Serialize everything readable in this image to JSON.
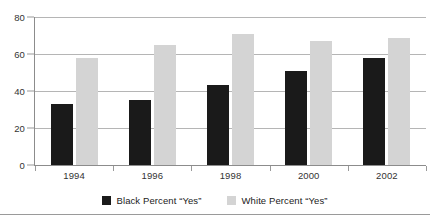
{
  "chart_data": {
    "type": "bar",
    "title": "",
    "subtitle": "",
    "xlabel": "",
    "ylabel": "",
    "categories": [
      "1994",
      "1996",
      "1998",
      "2000",
      "2002"
    ],
    "series": [
      {
        "name": "Black Percent “Yes”",
        "color": "#1a1a1a",
        "values": [
          33,
          35,
          43,
          51,
          58
        ]
      },
      {
        "name": "White Percent “Yes”",
        "color": "#d4d4d4",
        "values": [
          58,
          65,
          71,
          67,
          68.5
        ]
      }
    ],
    "ylim": [
      0,
      80
    ],
    "yticks": [
      0,
      20,
      40,
      60,
      80
    ],
    "ytick_labels": [
      "0",
      "20",
      "40",
      "60",
      "80"
    ],
    "grid": true,
    "grid_axis": "y",
    "legend_position": "bottom-center"
  },
  "legend": {
    "entries": [
      {
        "label": "Black Percent “Yes”",
        "swatch": "black"
      },
      {
        "label": "White Percent “Yes”",
        "swatch": "white"
      }
    ]
  },
  "colors": {
    "series_black": "#1a1a1a",
    "series_white": "#d4d4d4",
    "gridline": "#b5b5b5",
    "axis": "#8c8c8c",
    "text": "#333333",
    "background": "#ffffff"
  }
}
